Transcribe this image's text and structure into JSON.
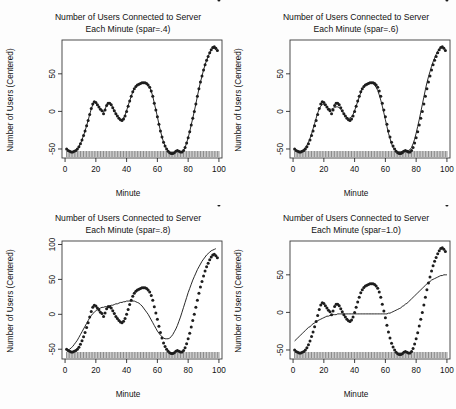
{
  "figure": {
    "layout": "2x2 grid of scatter plots with smoothing-spline overlays",
    "background_color": "#fdfdfd",
    "point_color": "#1d1d1d",
    "line_color": "#111111",
    "axis_color": "#2a2a2a"
  },
  "chart_data": [
    {
      "type": "scatter",
      "panel": "top-left",
      "title": "Number of Users Connected to Server",
      "title_line2": "Each Minute (spar=.4)",
      "spar": ".4",
      "xlabel": "Minute",
      "ylabel": "Number of Users (Centered)",
      "xlim": [
        -2,
        102
      ],
      "ylim": [
        -62,
        95
      ],
      "xticks": [
        0,
        20,
        40,
        60,
        80,
        100
      ],
      "yticks": [
        -50,
        0,
        50
      ],
      "grid": false,
      "legend": "none",
      "rug": true,
      "x": [
        1,
        2,
        3,
        4,
        5,
        6,
        7,
        8,
        9,
        10,
        11,
        12,
        13,
        14,
        15,
        16,
        17,
        18,
        19,
        20,
        21,
        22,
        23,
        24,
        25,
        26,
        27,
        28,
        29,
        30,
        31,
        32,
        33,
        34,
        35,
        36,
        37,
        38,
        39,
        40,
        41,
        42,
        43,
        44,
        45,
        46,
        47,
        48,
        49,
        50,
        51,
        52,
        53,
        54,
        55,
        56,
        57,
        58,
        59,
        60,
        61,
        62,
        63,
        64,
        65,
        66,
        67,
        68,
        69,
        70,
        71,
        72,
        73,
        74,
        75,
        76,
        77,
        78,
        79,
        80,
        81,
        82,
        83,
        84,
        85,
        86,
        87,
        88,
        89,
        90,
        91,
        92,
        93,
        94,
        95,
        96,
        97,
        98,
        99,
        100
      ],
      "y": [
        -50,
        -52,
        -53,
        -54,
        -54,
        -53,
        -52,
        -50,
        -47,
        -43,
        -38,
        -32,
        -26,
        -19,
        -12,
        -4,
        4,
        10,
        13,
        12,
        9,
        6,
        3,
        1,
        -3,
        2,
        8,
        11,
        11,
        9,
        5,
        1,
        -3,
        -6,
        -9,
        -11,
        -12,
        -10,
        -6,
        0,
        7,
        14,
        20,
        26,
        30,
        33,
        35,
        36,
        37,
        38,
        38,
        38,
        37,
        35,
        32,
        27,
        20,
        11,
        2,
        -7,
        -17,
        -26,
        -34,
        -41,
        -46,
        -50,
        -53,
        -55,
        -56,
        -56,
        -55,
        -53,
        -52,
        -53,
        -54,
        -54,
        -52,
        -48,
        -42,
        -35,
        -27,
        -18,
        -9,
        0,
        10,
        20,
        30,
        39,
        47,
        55,
        62,
        68,
        73,
        78,
        82,
        85,
        86,
        84,
        81
      ],
      "smooth": [
        -50,
        -52,
        -53,
        -54,
        -54,
        -53,
        -52,
        -50,
        -47,
        -43,
        -38,
        -32,
        -26,
        -19,
        -12,
        -4,
        3,
        9,
        12,
        12,
        9,
        6,
        3,
        1,
        -1,
        3,
        8,
        11,
        11,
        9,
        5,
        1,
        -3,
        -6,
        -9,
        -11,
        -11,
        -9,
        -5,
        1,
        8,
        14,
        20,
        26,
        30,
        33,
        35,
        36,
        37,
        38,
        38,
        38,
        37,
        35,
        32,
        27,
        20,
        11,
        2,
        -7,
        -17,
        -26,
        -34,
        -41,
        -46,
        -50,
        -53,
        -55,
        -56,
        -56,
        -55,
        -53,
        -52,
        -53,
        -54,
        -54,
        -52,
        -48,
        -42,
        -35,
        -27,
        -18,
        -9,
        0,
        10,
        20,
        30,
        39,
        47,
        55,
        62,
        68,
        73,
        78,
        82,
        84,
        84,
        82
      ]
    },
    {
      "type": "scatter",
      "panel": "top-right",
      "title": "Number of Users Connected to Server",
      "title_line2": "Each Minute (spar=.6)",
      "spar": ".6",
      "xlabel": "Minute",
      "ylabel": "Number of Users (Centered)",
      "xlim": [
        -2,
        102
      ],
      "ylim": [
        -62,
        95
      ],
      "xticks": [
        0,
        20,
        40,
        60,
        80,
        100
      ],
      "yticks": [
        -50,
        0,
        50
      ],
      "grid": false,
      "legend": "none",
      "rug": true,
      "x": [
        1,
        2,
        3,
        4,
        5,
        6,
        7,
        8,
        9,
        10,
        11,
        12,
        13,
        14,
        15,
        16,
        17,
        18,
        19,
        20,
        21,
        22,
        23,
        24,
        25,
        26,
        27,
        28,
        29,
        30,
        31,
        32,
        33,
        34,
        35,
        36,
        37,
        38,
        39,
        40,
        41,
        42,
        43,
        44,
        45,
        46,
        47,
        48,
        49,
        50,
        51,
        52,
        53,
        54,
        55,
        56,
        57,
        58,
        59,
        60,
        61,
        62,
        63,
        64,
        65,
        66,
        67,
        68,
        69,
        70,
        71,
        72,
        73,
        74,
        75,
        76,
        77,
        78,
        79,
        80,
        81,
        82,
        83,
        84,
        85,
        86,
        87,
        88,
        89,
        90,
        91,
        92,
        93,
        94,
        95,
        96,
        97,
        98,
        99,
        100
      ],
      "y": [
        -50,
        -52,
        -53,
        -54,
        -54,
        -53,
        -52,
        -50,
        -47,
        -43,
        -38,
        -32,
        -26,
        -19,
        -12,
        -4,
        4,
        10,
        13,
        12,
        9,
        6,
        3,
        1,
        -3,
        2,
        8,
        11,
        11,
        9,
        5,
        1,
        -3,
        -6,
        -9,
        -11,
        -12,
        -10,
        -6,
        0,
        7,
        14,
        20,
        26,
        30,
        33,
        35,
        36,
        37,
        38,
        38,
        38,
        37,
        35,
        32,
        27,
        20,
        11,
        2,
        -7,
        -17,
        -26,
        -34,
        -41,
        -46,
        -50,
        -53,
        -55,
        -56,
        -56,
        -55,
        -53,
        -52,
        -53,
        -54,
        -54,
        -52,
        -48,
        -42,
        -35,
        -27,
        -18,
        -9,
        0,
        10,
        20,
        30,
        39,
        47,
        55,
        62,
        68,
        73,
        78,
        82,
        85,
        86,
        84,
        81
      ],
      "smooth": [
        -51,
        -52,
        -53,
        -53,
        -53,
        -52,
        -50,
        -48,
        -45,
        -41,
        -36,
        -30,
        -23,
        -16,
        -9,
        -2,
        3,
        7,
        9,
        9,
        8,
        6,
        4,
        3,
        3,
        4,
        5,
        6,
        6,
        5,
        3,
        0,
        -3,
        -6,
        -8,
        -9,
        -9,
        -7,
        -4,
        1,
        7,
        13,
        19,
        25,
        30,
        33,
        36,
        37,
        38,
        38,
        38,
        37,
        35,
        32,
        28,
        22,
        15,
        7,
        -2,
        -11,
        -20,
        -29,
        -36,
        -43,
        -48,
        -51,
        -53,
        -54,
        -54,
        -54,
        -53,
        -52,
        -52,
        -52,
        -52,
        -51,
        -48,
        -43,
        -37,
        -29,
        -20,
        -11,
        -1,
        9,
        19,
        29,
        38,
        46,
        53,
        60,
        66,
        71,
        76,
        80,
        83,
        85,
        85,
        83
      ]
    },
    {
      "type": "scatter",
      "panel": "bottom-left",
      "title": "Number of Users Connected to Server",
      "title_line2": "Each Minute (spar=.8)",
      "spar": ".8",
      "xlabel": "Minute",
      "ylabel": "Number of Users (Centered)",
      "xlim": [
        -2,
        102
      ],
      "ylim": [
        -64,
        105
      ],
      "xticks": [
        0,
        20,
        40,
        60,
        80,
        100
      ],
      "yticks": [
        -50,
        0,
        50,
        100
      ],
      "grid": false,
      "legend": "none",
      "rug": true,
      "x": [
        1,
        2,
        3,
        4,
        5,
        6,
        7,
        8,
        9,
        10,
        11,
        12,
        13,
        14,
        15,
        16,
        17,
        18,
        19,
        20,
        21,
        22,
        23,
        24,
        25,
        26,
        27,
        28,
        29,
        30,
        31,
        32,
        33,
        34,
        35,
        36,
        37,
        38,
        39,
        40,
        41,
        42,
        43,
        44,
        45,
        46,
        47,
        48,
        49,
        50,
        51,
        52,
        53,
        54,
        55,
        56,
        57,
        58,
        59,
        60,
        61,
        62,
        63,
        64,
        65,
        66,
        67,
        68,
        69,
        70,
        71,
        72,
        73,
        74,
        75,
        76,
        77,
        78,
        79,
        80,
        81,
        82,
        83,
        84,
        85,
        86,
        87,
        88,
        89,
        90,
        91,
        92,
        93,
        94,
        95,
        96,
        97,
        98,
        99,
        100
      ],
      "y": [
        -50,
        -52,
        -53,
        -54,
        -54,
        -53,
        -52,
        -50,
        -47,
        -43,
        -38,
        -32,
        -26,
        -19,
        -12,
        -4,
        4,
        10,
        13,
        12,
        9,
        6,
        3,
        1,
        -3,
        2,
        8,
        11,
        11,
        9,
        5,
        1,
        -3,
        -6,
        -9,
        -11,
        -12,
        -10,
        -6,
        0,
        7,
        14,
        20,
        26,
        30,
        33,
        35,
        36,
        37,
        38,
        38,
        38,
        37,
        35,
        32,
        27,
        20,
        11,
        2,
        -7,
        -17,
        -26,
        -34,
        -41,
        -46,
        -50,
        -53,
        -55,
        -56,
        -56,
        -55,
        -53,
        -52,
        -53,
        -54,
        -54,
        -52,
        -48,
        -42,
        -35,
        -27,
        -18,
        -9,
        0,
        10,
        20,
        30,
        39,
        47,
        55,
        62,
        68,
        73,
        78,
        82,
        85,
        86,
        84,
        81
      ],
      "smooth": [
        -52,
        -51,
        -50,
        -48,
        -46,
        -43,
        -40,
        -37,
        -33,
        -29,
        -25,
        -21,
        -17,
        -13,
        -9,
        -5,
        -2,
        1,
        3,
        5,
        7,
        8,
        9,
        10,
        10,
        11,
        11,
        12,
        12,
        13,
        13,
        14,
        15,
        15,
        16,
        17,
        17,
        18,
        18,
        19,
        19,
        19,
        19,
        19,
        19,
        18,
        17,
        16,
        14,
        12,
        9,
        6,
        3,
        0,
        -4,
        -8,
        -12,
        -16,
        -20,
        -24,
        -27,
        -30,
        -32,
        -34,
        -35,
        -35,
        -35,
        -34,
        -32,
        -29,
        -25,
        -21,
        -16,
        -10,
        -4,
        3,
        10,
        17,
        24,
        31,
        37,
        43,
        49,
        54,
        59,
        64,
        68,
        72,
        76,
        79,
        82,
        85,
        87,
        89,
        91,
        92,
        93,
        94
      ]
    },
    {
      "type": "scatter",
      "panel": "bottom-right",
      "title": "Number of Users Connected to Server",
      "title_line2": "Each Minute (spar=1.0)",
      "spar": "1.0",
      "xlabel": "Minute",
      "ylabel": "Number of Users (Centered)",
      "xlim": [
        -2,
        102
      ],
      "ylim": [
        -62,
        95
      ],
      "xticks": [
        0,
        20,
        40,
        60,
        80,
        100
      ],
      "yticks": [
        -50,
        0,
        50
      ],
      "grid": false,
      "legend": "none",
      "rug": true,
      "x": [
        1,
        2,
        3,
        4,
        5,
        6,
        7,
        8,
        9,
        10,
        11,
        12,
        13,
        14,
        15,
        16,
        17,
        18,
        19,
        20,
        21,
        22,
        23,
        24,
        25,
        26,
        27,
        28,
        29,
        30,
        31,
        32,
        33,
        34,
        35,
        36,
        37,
        38,
        39,
        40,
        41,
        42,
        43,
        44,
        45,
        46,
        47,
        48,
        49,
        50,
        51,
        52,
        53,
        54,
        55,
        56,
        57,
        58,
        59,
        60,
        61,
        62,
        63,
        64,
        65,
        66,
        67,
        68,
        69,
        70,
        71,
        72,
        73,
        74,
        75,
        76,
        77,
        78,
        79,
        80,
        81,
        82,
        83,
        84,
        85,
        86,
        87,
        88,
        89,
        90,
        91,
        92,
        93,
        94,
        95,
        96,
        97,
        98,
        99,
        100
      ],
      "y": [
        -50,
        -52,
        -53,
        -54,
        -54,
        -53,
        -52,
        -50,
        -47,
        -43,
        -38,
        -32,
        -26,
        -19,
        -12,
        -4,
        4,
        10,
        13,
        12,
        9,
        6,
        3,
        1,
        -3,
        2,
        8,
        11,
        11,
        9,
        5,
        1,
        -3,
        -6,
        -9,
        -11,
        -12,
        -10,
        -6,
        0,
        7,
        14,
        20,
        26,
        30,
        33,
        35,
        36,
        37,
        38,
        38,
        38,
        37,
        35,
        32,
        27,
        20,
        11,
        2,
        -7,
        -17,
        -26,
        -34,
        -41,
        -46,
        -50,
        -53,
        -55,
        -56,
        -56,
        -55,
        -53,
        -52,
        -53,
        -54,
        -54,
        -52,
        -48,
        -42,
        -35,
        -27,
        -18,
        -9,
        0,
        10,
        20,
        30,
        39,
        47,
        55,
        62,
        68,
        73,
        78,
        82,
        85,
        86,
        84,
        81
      ],
      "smooth": [
        -38,
        -36,
        -34,
        -32,
        -30,
        -28,
        -26,
        -24,
        -22,
        -20,
        -19,
        -17,
        -15,
        -14,
        -12,
        -11,
        -10,
        -9,
        -8,
        -7,
        -6,
        -5,
        -5,
        -4,
        -4,
        -3,
        -3,
        -3,
        -2,
        -2,
        -2,
        -2,
        -2,
        -2,
        -2,
        -2,
        -2,
        -2,
        -2,
        -2,
        -2,
        -2,
        -2,
        -2,
        -2,
        -2,
        -2,
        -2,
        -2,
        -2,
        -2,
        -2,
        -2,
        -2,
        -2,
        -2,
        -2,
        -2,
        -2,
        -2,
        -2,
        -1,
        -1,
        0,
        1,
        2,
        3,
        4,
        5,
        6,
        8,
        9,
        11,
        12,
        14,
        16,
        18,
        20,
        22,
        24,
        26,
        28,
        30,
        32,
        34,
        36,
        38,
        40,
        41,
        43,
        44,
        45,
        46,
        47,
        48,
        49,
        49,
        50,
        50,
        50,
        50
      ]
    }
  ]
}
